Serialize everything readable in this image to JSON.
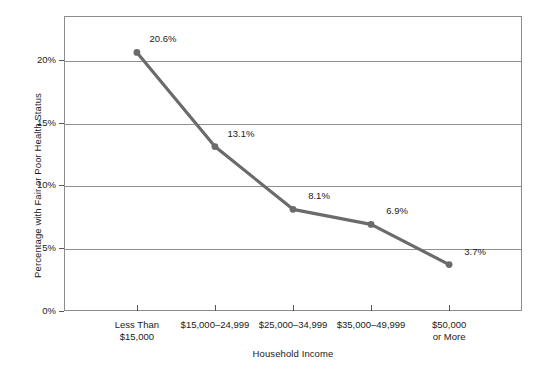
{
  "chart_data": {
    "type": "line",
    "title": "",
    "xlabel": "Household Income",
    "ylabel": "Percentage with Fair or Poor Health Status",
    "categories": [
      "Less Than\n$15,000",
      "$15,000–24,999",
      "$25,000–34,999",
      "$35,000–49,999",
      "$50,000\nor More"
    ],
    "values": [
      20.6,
      13.1,
      8.1,
      6.9,
      3.7
    ],
    "point_labels": [
      "20.6%",
      "13.1%",
      "8.1%",
      "6.9%",
      "3.7%"
    ],
    "ylim": [
      0,
      23.5
    ],
    "yticks": [
      0,
      5,
      10,
      15,
      20
    ],
    "ytick_labels": [
      "0%",
      "5%",
      "10%",
      "15%",
      "20%"
    ],
    "grid": true,
    "grid_axis": "y",
    "legend": false,
    "series_color": "#6b6b6b",
    "marker_color": "#6b6b6b",
    "grid_color": "#909090",
    "frame_color": "#8c8c8c",
    "text_color": "#1a1a1a",
    "background": "#ffffff"
  }
}
